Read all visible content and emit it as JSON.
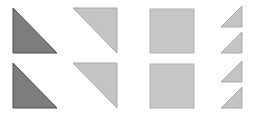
{
  "figure": {
    "width": 253,
    "height": 119,
    "background_color": "#ffffff",
    "rows": 2,
    "columns": 4
  },
  "palette": {
    "dark_gray_fill": "#7d7d7d",
    "dark_gray_stroke": "#4f4f4f",
    "light_gray_fill": "#c4c4c4",
    "light_gray_stroke": "#a8a8a8",
    "square_fill": "#c6c6c6",
    "square_stroke": "#b0b0b0",
    "background": "#ffffff"
  },
  "shapes": [
    {
      "id": "row1-col1",
      "name": "dark-triangle-top-left",
      "type": "right-triangle",
      "orientation": "right-angle-bottom-left",
      "fill": "#7d7d7d",
      "stroke": "#4f4f4f",
      "x": 13,
      "y": 8,
      "width": 44,
      "height": 45,
      "points": "13,8 13,53 57,53"
    },
    {
      "id": "row1-col2",
      "name": "light-triangle-top-left",
      "type": "right-triangle",
      "orientation": "right-angle-top-right",
      "fill": "#c4c4c4",
      "stroke": "#a8a8a8",
      "x": 73,
      "y": 8,
      "width": 44,
      "height": 45,
      "points": "73,8 117,8 117,53"
    },
    {
      "id": "row1-col3",
      "name": "light-square-top",
      "type": "square",
      "orientation": "axis-aligned",
      "fill": "#c6c6c6",
      "stroke": "#b0b0b0",
      "x": 150,
      "y": 9,
      "width": 44,
      "height": 44,
      "points": "150,9 194,9 194,53 150,53"
    },
    {
      "id": "row1-col4-a",
      "name": "small-light-triangle-1",
      "type": "right-triangle",
      "orientation": "right-angle-bottom-right",
      "fill": "#c4c4c4",
      "stroke": "#a8a8a8",
      "x": 221,
      "y": 6,
      "width": 21,
      "height": 21,
      "points": "242,6 242,27 221,27"
    },
    {
      "id": "row1-col4-b",
      "name": "small-light-triangle-2",
      "type": "right-triangle",
      "orientation": "right-angle-bottom-right",
      "fill": "#c4c4c4",
      "stroke": "#a8a8a8",
      "x": 221,
      "y": 32,
      "width": 21,
      "height": 21,
      "points": "242,32 242,53 221,53"
    },
    {
      "id": "row2-col1",
      "name": "dark-triangle-bottom-left",
      "type": "right-triangle",
      "orientation": "right-angle-bottom-left",
      "fill": "#7d7d7d",
      "stroke": "#4f4f4f",
      "x": 13,
      "y": 63,
      "width": 44,
      "height": 45,
      "points": "13,63 13,108 57,108"
    },
    {
      "id": "row2-col2",
      "name": "light-triangle-bottom-left",
      "type": "right-triangle",
      "orientation": "right-angle-top-right",
      "fill": "#c4c4c4",
      "stroke": "#a8a8a8",
      "x": 73,
      "y": 63,
      "width": 44,
      "height": 45,
      "points": "73,63 117,63 117,108"
    },
    {
      "id": "row2-col3",
      "name": "light-square-bottom",
      "type": "square",
      "orientation": "axis-aligned",
      "fill": "#c6c6c6",
      "stroke": "#b0b0b0",
      "x": 150,
      "y": 64,
      "width": 44,
      "height": 44,
      "points": "150,64 194,64 194,108 150,108"
    },
    {
      "id": "row2-col4-a",
      "name": "small-light-triangle-3",
      "type": "right-triangle",
      "orientation": "right-angle-bottom-right",
      "fill": "#c4c4c4",
      "stroke": "#a8a8a8",
      "x": 221,
      "y": 61,
      "width": 21,
      "height": 21,
      "points": "242,61 242,82 221,82"
    },
    {
      "id": "row2-col4-b",
      "name": "small-light-triangle-4",
      "type": "right-triangle",
      "orientation": "right-angle-bottom-right",
      "fill": "#c4c4c4",
      "stroke": "#a8a8a8",
      "x": 221,
      "y": 87,
      "width": 21,
      "height": 21,
      "points": "242,87 242,108 221,108"
    }
  ]
}
